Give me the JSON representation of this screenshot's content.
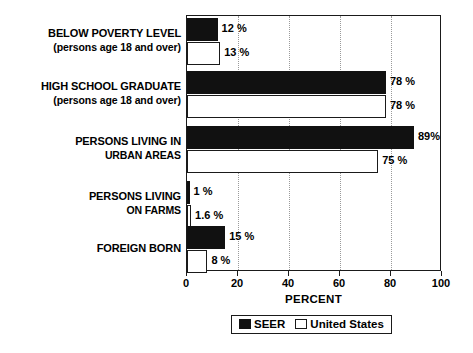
{
  "chart_data": {
    "type": "bar",
    "orientation": "horizontal",
    "title": "",
    "xlabel": "PERCENT",
    "ylabel": "",
    "xlim": [
      0,
      100
    ],
    "xticks": [
      0,
      20,
      40,
      60,
      80,
      100
    ],
    "grid": true,
    "grid_axis": "x",
    "legend_position": "bottom-center",
    "categories": [
      "BELOW POVERTY LEVEL",
      "HIGH SCHOOL GRADUATE",
      "PERSONS LIVING IN URBAN AREAS",
      "PERSONS LIVING ON FARMS",
      "FOREIGN BORN"
    ],
    "category_labels": [
      {
        "line1": "BELOW POVERTY LEVEL",
        "line2": "(persons age 18 and over)"
      },
      {
        "line1": "HIGH SCHOOL GRADUATE",
        "line2": "(persons age 18 and over)"
      },
      {
        "line1": "PERSONS LIVING IN",
        "line2": "URBAN AREAS"
      },
      {
        "line1": "PERSONS LIVING",
        "line2": "ON FARMS"
      },
      {
        "line1": "FOREIGN BORN",
        "line2": ""
      }
    ],
    "series": [
      {
        "name": "SEER",
        "color": "#111111",
        "values": [
          12,
          78,
          89,
          1,
          15
        ],
        "value_labels": [
          "12 %",
          "78 %",
          "89%",
          "1 %",
          "15 %"
        ]
      },
      {
        "name": "United States",
        "color": "#ffffff",
        "values": [
          13,
          78,
          75,
          1.6,
          8
        ],
        "value_labels": [
          "13 %",
          "78 %",
          "75 %",
          "1.6 %",
          "8 %"
        ]
      }
    ]
  },
  "legend": {
    "items": [
      {
        "label": "SEER",
        "swatch": "filled-square-icon"
      },
      {
        "label": "United States",
        "swatch": "hollow-square-icon"
      }
    ]
  },
  "axis": {
    "x_title": "PERCENT",
    "tick_labels": [
      "0",
      "20",
      "40",
      "60",
      "80",
      "100"
    ]
  }
}
